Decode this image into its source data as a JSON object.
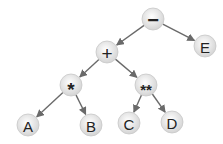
{
  "diagram": {
    "type": "expression-tree",
    "node_radius": 11,
    "colors": {
      "edge": "#6a6a6a",
      "node_fill_center": "#ffffff",
      "node_fill_edge": "#d4d4d4",
      "node_stroke": "#c8c8c8",
      "text": "#222222"
    },
    "nodes": [
      {
        "id": "minus",
        "label": "−",
        "x": 153,
        "y": 19,
        "font_size": 20
      },
      {
        "id": "E",
        "label": "E",
        "x": 205,
        "y": 46,
        "font_size": 15
      },
      {
        "id": "plus",
        "label": "+",
        "x": 107,
        "y": 52,
        "font_size": 19
      },
      {
        "id": "mul",
        "label": "*",
        "x": 71,
        "y": 85,
        "font_size": 19
      },
      {
        "id": "pow",
        "label": "**",
        "x": 146,
        "y": 85,
        "font_size": 15
      },
      {
        "id": "A",
        "label": "A",
        "x": 28,
        "y": 125,
        "font_size": 15
      },
      {
        "id": "B",
        "label": "B",
        "x": 91,
        "y": 125,
        "font_size": 15
      },
      {
        "id": "C",
        "label": "C",
        "x": 129,
        "y": 123,
        "font_size": 15
      },
      {
        "id": "D",
        "label": "D",
        "x": 172,
        "y": 122,
        "font_size": 15
      }
    ],
    "edges": [
      {
        "from": "minus",
        "to": "plus"
      },
      {
        "from": "minus",
        "to": "E"
      },
      {
        "from": "plus",
        "to": "mul"
      },
      {
        "from": "plus",
        "to": "pow"
      },
      {
        "from": "mul",
        "to": "A"
      },
      {
        "from": "mul",
        "to": "B"
      },
      {
        "from": "pow",
        "to": "C"
      },
      {
        "from": "pow",
        "to": "D"
      }
    ]
  }
}
